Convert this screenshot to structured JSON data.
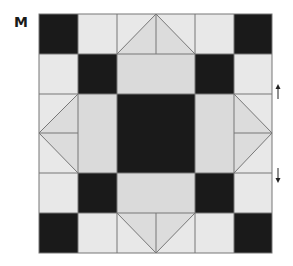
{
  "diagram": {
    "label": "M",
    "grid": {
      "columns": 6,
      "rows": 6,
      "x_lines": [
        39,
        78,
        117,
        156,
        195,
        234,
        272
      ],
      "y_lines": [
        14,
        54,
        94,
        133,
        173,
        213,
        253
      ]
    },
    "colors": {
      "dark": "#1a1a1a",
      "light": "#e8e8e8",
      "medium": "#dadada",
      "line": "#777777"
    },
    "annotations": [
      {
        "type": "arrow",
        "direction": "up",
        "label": "↑"
      },
      {
        "type": "arrow",
        "direction": "down",
        "label": "↓"
      }
    ]
  }
}
